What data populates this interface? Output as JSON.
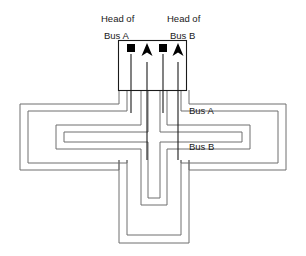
{
  "diagram": {
    "type": "network-topology",
    "background_color": "#ffffff",
    "line_color": "#6e6e6e",
    "dark_line_color": "#1a1a1a",
    "marker_color": "#000000"
  },
  "labels": {
    "head_of_a_line1": "Head of",
    "head_of_a_line2": "Bus A",
    "head_of_b_line1": "Head of",
    "head_of_b_line2": "Bus B",
    "bus_a": "Bus A",
    "bus_b": "Bus B"
  },
  "head_box": {
    "x": 118,
    "y": 40,
    "width": 68,
    "height": 50
  },
  "markers": [
    {
      "name": "bus-a-head-square",
      "kind": "square",
      "x": 129,
      "y": 45
    },
    {
      "name": "bus-a-arrow",
      "kind": "arrow-up",
      "x": 145,
      "y": 45
    },
    {
      "name": "bus-b-head-square",
      "kind": "square",
      "x": 161,
      "y": 45
    },
    {
      "name": "bus-b-arrow",
      "kind": "arrow-up",
      "x": 176,
      "y": 45
    }
  ],
  "paths": {
    "bus_a_outer": "M 129 53 L 129 117 L 22 117 L 22 168 L 78 168 L 78 133 L 228 133 L 228 168 L 284 168 L 284 117 L 176 117 L 176 53",
    "bus_a_inner": "M 145 53 L 145 200 L 125 200 L 125 238 L 183 238 L 183 200 L 161 200 L 161 53",
    "left_u_outer": "M 18 105 L 18 161 L 72 161 L 72 126",
    "left_u_mid": "M 28 112 L 28 152 L 64 152 L 64 126",
    "right_u_outer": "M 288 105 L 288 161 L 234 161 L 234 126",
    "right_u_mid": "M 278 112 L 278 152 L 242 152 L 242 126",
    "bottom_u_outer": "M 118 196 L 118 243 L 190 243 L 190 196",
    "bottom_u_mid": "M 128 203 L 128 234 L 180 234 L 180 203"
  },
  "label_positions": {
    "head_of_a_line1": {
      "x": 101,
      "y": 22
    },
    "head_of_a_line2": {
      "x": 105,
      "y": 39
    },
    "head_of_b_line1": {
      "x": 167,
      "y": 22
    },
    "head_of_b_line2": {
      "x": 171,
      "y": 39
    },
    "bus_a": {
      "x": 189,
      "y": 114
    },
    "bus_b": {
      "x": 189,
      "y": 150
    }
  }
}
